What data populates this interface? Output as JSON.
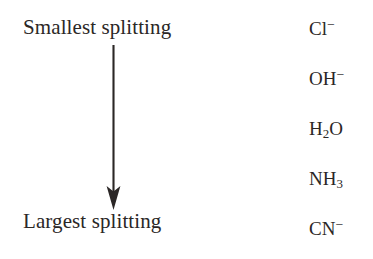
{
  "figure": {
    "title_top": "Smallest splitting",
    "title_bottom": "Largest splitting",
    "arrow": {
      "name": "downward-arrow",
      "direction": "down",
      "color": "#2b2726"
    },
    "background_color": "#ffffff",
    "text_color": "#2b2726"
  },
  "ligands": [
    {
      "formula": "Cl",
      "sub": "",
      "sup": "−"
    },
    {
      "formula": "OH",
      "sub": "",
      "sup": "−"
    },
    {
      "formula": "H",
      "sub": "2",
      "sup": "",
      "tail": "O"
    },
    {
      "formula": "NH",
      "sub": "3",
      "sup": ""
    },
    {
      "formula": "CN",
      "sub": "",
      "sup": "−"
    }
  ],
  "ligand_plain": [
    "Cl⁻",
    "OH⁻",
    "H₂O",
    "NH₃",
    "CN⁻"
  ]
}
